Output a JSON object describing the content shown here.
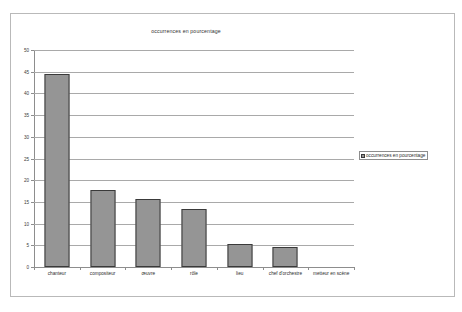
{
  "chart_data": {
    "type": "bar",
    "title": "occurrences en pourcentage",
    "xlabel": "",
    "ylabel": "",
    "ylim": [
      0,
      50
    ],
    "yticks": [
      0,
      5,
      10,
      15,
      20,
      25,
      30,
      35,
      40,
      45,
      50
    ],
    "grid": true,
    "legend_position": "right",
    "categories": [
      "chanteur",
      "compositeur",
      "œuvre",
      "rôle",
      "lieu",
      "chef d'orchestre",
      "metteur en scène"
    ],
    "series": [
      {
        "name": "occurrences en pourcentage",
        "values": [
          44.5,
          17.7,
          15.7,
          13.4,
          5.3,
          4.6,
          0
        ]
      }
    ],
    "colors": {
      "bar_fill": "#959595",
      "bar_stroke": "#3a3a3a",
      "gridline": "#a9a9a9",
      "axis": "#8d8d8d",
      "frame": "#b9b9b9",
      "background": "#ffffff",
      "text": "#2b2b2b"
    }
  },
  "legend": {
    "entries": [
      {
        "label": "occurrences en pourcentage",
        "color": "#959595"
      }
    ]
  }
}
